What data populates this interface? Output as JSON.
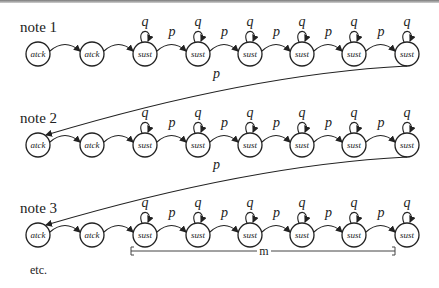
{
  "diagram": {
    "rows": [
      {
        "label": "note 1",
        "y": 54,
        "label_y": 32
      },
      {
        "label": "note 2",
        "y": 145,
        "label_y": 123
      },
      {
        "label": "note 3",
        "y": 235,
        "label_y": 213
      }
    ],
    "nodes": [
      {
        "x": 38,
        "text": "atck"
      },
      {
        "x": 92,
        "text": "atck"
      },
      {
        "x": 145,
        "text": "sust"
      },
      {
        "x": 198,
        "text": "sust"
      },
      {
        "x": 250,
        "text": "sust"
      },
      {
        "x": 302,
        "text": "sust"
      },
      {
        "x": 354,
        "text": "sust"
      },
      {
        "x": 407,
        "text": "sust"
      }
    ],
    "self_loop_label": "q",
    "transition_label": "p",
    "return_label": "p",
    "bracket_label": "m",
    "footer": "etc."
  },
  "labels": {
    "row1": "note 1",
    "row2": "note 2",
    "row3": "note 3",
    "footer": "etc.",
    "bracket": "m"
  }
}
